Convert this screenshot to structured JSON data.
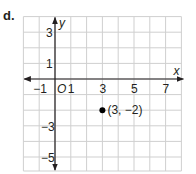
{
  "part_label": "d.",
  "chart_data": {
    "type": "scatter",
    "title": "",
    "xlabel": "x",
    "ylabel": "y",
    "xlim": [
      -2,
      8
    ],
    "ylim": [
      -6,
      4
    ],
    "grid": true,
    "grid_step": 1,
    "origin_label": "O",
    "x_ticks": [
      -1,
      1,
      3,
      5,
      7
    ],
    "x_tick_labels": [
      "−1",
      "1",
      "3",
      "5",
      "7"
    ],
    "y_ticks": [
      3,
      1,
      -3,
      -5
    ],
    "y_tick_labels": [
      "3",
      "1",
      "−3",
      "−5"
    ],
    "points": [
      {
        "x": 3,
        "y": -2,
        "label": "(3, −2)"
      }
    ],
    "colors": {
      "grid": "#cfcfcf",
      "axis": "#231f20",
      "point": "#000000",
      "text": "#231f20"
    }
  }
}
